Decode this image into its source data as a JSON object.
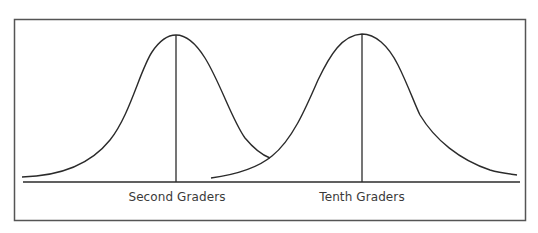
{
  "diagram": {
    "type": "two overlapping normal distribution curves",
    "curves": [
      {
        "id": "second",
        "label": "Second Graders",
        "mean_x": 176,
        "peak_y": 35
      },
      {
        "id": "tenth",
        "label": "Tenth Graders",
        "mean_x": 362,
        "peak_y": 34
      }
    ],
    "colors": {
      "line": "#2b2b2b",
      "frame": "#555555",
      "text": "#3a3a3a",
      "background": "#ffffff"
    }
  }
}
